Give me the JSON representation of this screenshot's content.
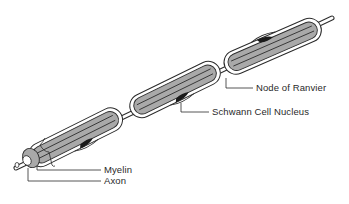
{
  "diagram": {
    "colors": {
      "myelin_fill": "#a9a9a9",
      "outline": "#2b2b2b",
      "nucleus": "#1a1a1a",
      "background": "#ffffff"
    },
    "labels": {
      "node_of_ranvier": "Node of Ranvier",
      "schwann_cell_nucleus": "Schwann Cell Nucleus",
      "myelin": "Myelin",
      "axon": "Axon"
    },
    "segments": [
      {
        "id": "segment-1",
        "start": [
          35,
          158
        ],
        "end": [
          126,
          113
        ]
      },
      {
        "id": "segment-2",
        "start": [
          134,
          110
        ],
        "end": [
          219,
          68
        ]
      },
      {
        "id": "segment-3",
        "start": [
          228,
          66
        ],
        "end": [
          322,
          25
        ]
      }
    ],
    "nodes_of_ranvier": [
      {
        "id": "node-1",
        "at": [
          130,
          112
        ]
      },
      {
        "id": "node-2",
        "at": [
          224,
          68
        ]
      }
    ]
  }
}
